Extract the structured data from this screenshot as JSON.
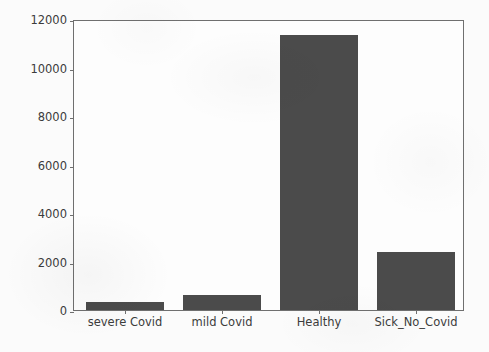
{
  "chart_data": {
    "type": "bar",
    "title": "",
    "xlabel": "",
    "ylabel": "",
    "categories": [
      "severe Covid",
      "mild Covid",
      "Healthy",
      "Sick_No_Covid"
    ],
    "values": [
      350,
      630,
      11700,
      2480
    ],
    "ylim": [
      0,
      12300
    ],
    "yticks": [
      0,
      2000,
      4000,
      6000,
      8000,
      10000,
      12000
    ],
    "ytick_labels": [
      "0",
      "2000",
      "4000",
      "6000",
      "8000",
      "10000",
      "12000"
    ],
    "grid": false,
    "legend": null,
    "bar_color": "#4b4b4b",
    "axis_color": "#6f6f6f",
    "background_color": "#fbfbfb"
  }
}
